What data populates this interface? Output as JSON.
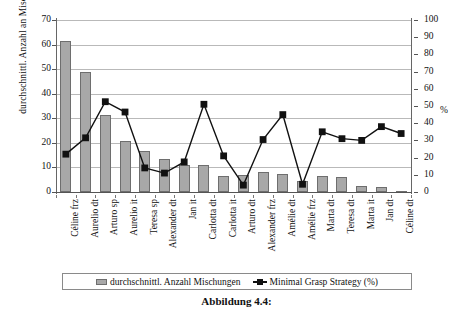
{
  "figure": {
    "caption": "Abbildung 4.4:"
  },
  "axes": {
    "left_label": "durchschnittl. Anzahl an Mischungen",
    "right_unit_label": "%",
    "left_ticks": [
      "0",
      "10",
      "20",
      "30",
      "40",
      "50",
      "60",
      "70"
    ],
    "right_ticks": [
      "0",
      "10",
      "20",
      "30",
      "40",
      "50",
      "60",
      "70",
      "80",
      "90",
      "100"
    ]
  },
  "legend": {
    "items": [
      {
        "label": "durchschnittl. Anzahl Mischungen",
        "marker": "bar-swatch",
        "color": "#a8a8a8"
      },
      {
        "label": "Minimal Grasp Strategy (%)",
        "marker": "line-square-marker",
        "color": "#111111"
      }
    ]
  },
  "chart_data": {
    "type": "bar",
    "title": "",
    "xlabel": "",
    "ylabel": "durchschnittl. Anzahl an Mischungen",
    "y2label": "%",
    "ylim": [
      0,
      70
    ],
    "y2lim": [
      0,
      100
    ],
    "grid": true,
    "legend_position": "bottom",
    "categories": [
      "Céline frz",
      "Aurelio dt",
      "Arturo sp",
      "Aurelio it",
      "Teresa sp",
      "Alexander dt",
      "Jan it",
      "Carlotta dt",
      "Carlotta it",
      "Arturo dt",
      "Alexander frz",
      "Amélie dt",
      "Amélie frz",
      "Marta dt",
      "Teresa dt",
      "Marta it",
      "Jan dt",
      "Céline dt"
    ],
    "series": [
      {
        "name": "durchschnittl. Anzahl Mischungen",
        "type": "bar",
        "axis": "left",
        "color": "#a8a8a8",
        "values": [
          61.5,
          48.7,
          31.2,
          20.8,
          16.7,
          13.5,
          11.0,
          11.0,
          6.5,
          7.0,
          8.0,
          7.5,
          4.5,
          6.5,
          6.0,
          2.5,
          2.0,
          0.5
        ]
      },
      {
        "name": "Minimal Grasp Strategy (%)",
        "type": "line",
        "axis": "right",
        "color": "#111111",
        "values": [
          22,
          31.5,
          52.5,
          46.5,
          14,
          11,
          17.5,
          51,
          21,
          4,
          30.5,
          45,
          4.5,
          35,
          31,
          30,
          38,
          34
        ]
      }
    ]
  }
}
